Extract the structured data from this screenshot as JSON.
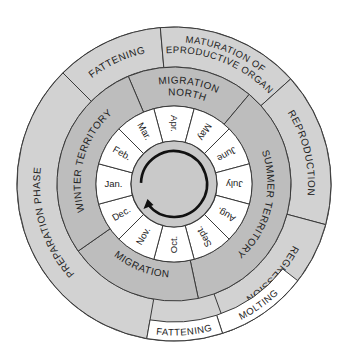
{
  "diagram": {
    "center": [
      174,
      184
    ],
    "radii": {
      "hub": 43,
      "hub_inner_circle": 33,
      "months_outer": 78,
      "territory_outer": 117,
      "phase_outer": 157,
      "molting_inner": 138
    },
    "colors": {
      "background": "#ffffff",
      "outer_ring": "#d2d2d2",
      "middle_ring": "#bdbdbd",
      "month_ring": "#ffffff",
      "hub": "#c9c9c9",
      "line": "#3a3a3a",
      "text": "#222222",
      "white_box": "#ffffff"
    },
    "months": [
      {
        "label": "Apr.",
        "angle": 0
      },
      {
        "label": "May",
        "angle": 30
      },
      {
        "label": "June",
        "angle": 60
      },
      {
        "label": "July",
        "angle": 90
      },
      {
        "label": "Aug.",
        "angle": 120
      },
      {
        "label": "Sept.",
        "angle": 150
      },
      {
        "label": "Oct.",
        "angle": 180
      },
      {
        "label": "Nov.",
        "angle": 210
      },
      {
        "label": "Dec.",
        "angle": 240
      },
      {
        "label": "Jan.",
        "angle": 270
      },
      {
        "label": "Feb.",
        "angle": 300
      },
      {
        "label": "Mar.",
        "angle": 330
      }
    ],
    "territory_ring": [
      {
        "label_lines": [
          "MIGRATION",
          "NORTH"
        ],
        "start": -23,
        "end": 40,
        "flip": false
      },
      {
        "label_lines": [
          "SUMMER TERRITORY"
        ],
        "start": 40,
        "end": 168,
        "flip": false
      },
      {
        "label_lines": [
          "MIGRATION"
        ],
        "start": 168,
        "end": 235,
        "flip": true
      },
      {
        "label_lines": [
          "WINTER TERRITORY"
        ],
        "start": 235,
        "end": 337,
        "flip": false
      }
    ],
    "phase_ring": [
      {
        "label_lines": [
          "FATTENING"
        ],
        "start": -45,
        "end": -5,
        "flip": false
      },
      {
        "label_lines": [
          "MATURATION OF",
          "REPRODUCTIVE ORGANS"
        ],
        "start": -5,
        "end": 48,
        "flip": false
      },
      {
        "label_lines": [
          "REPRODUCTION"
        ],
        "start": 48,
        "end": 105,
        "flip": false
      },
      {
        "label_lines": [
          "REGRESSION"
        ],
        "start": 105,
        "end": 160,
        "flip": false
      },
      {
        "label_lines": [
          "PREPARATION PHASE"
        ],
        "start": 190,
        "end": 315,
        "flip": false
      }
    ],
    "white_boxes": [
      {
        "label": "MOLTING",
        "start": 128,
        "end": 162,
        "flip": true
      },
      {
        "label": "FATTENING",
        "start": 162,
        "end": 190,
        "flip": true
      }
    ],
    "cycle_arrow": {
      "direction": "clockwise",
      "icon": "circular-arrow-icon"
    }
  }
}
